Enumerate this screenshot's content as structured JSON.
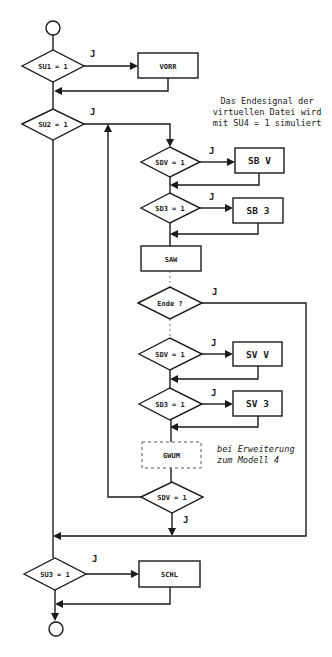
{
  "diagram": {
    "type": "flowchart",
    "terminals": {
      "start": {
        "shape": "circle"
      },
      "end": {
        "shape": "circle"
      }
    },
    "decisions": {
      "su1": "SU1 = 1",
      "su2": "SU2 = 1",
      "sdv_a": "SDV = 1",
      "sd3_a": "SD3 = 1",
      "ende": "Ende ?",
      "sdv_b": "SDV = 1",
      "sd3_b": "SD3 = 1",
      "sdv_c": "SDV = 1",
      "su3": "SU3 = 1"
    },
    "processes": {
      "vorr": "VORR",
      "sbv": "SB V",
      "sb3": "SB 3",
      "saw": "SAW",
      "svv": "SV V",
      "sv3": "SV 3",
      "gwum": "GWUM",
      "schl": "SCHL"
    },
    "yes_label": "J",
    "notes": {
      "endsignal": [
        "Das Endesignal der",
        "virtuellen Datei wird",
        "mit SU4 = 1 simuliert"
      ],
      "extension": [
        "bei Erweiterung",
        "zum Modell 4"
      ]
    }
  }
}
